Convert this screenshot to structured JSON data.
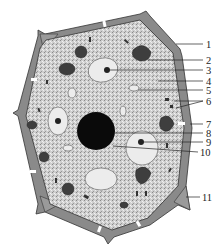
{
  "diagram": {
    "title": "",
    "type": "plant cell structure",
    "colors": {
      "background": "#ffffff",
      "cytoplasm": "#c9c9c9",
      "cell_wall": "#7a7a7a",
      "cell_wall_edge": "#3a3a3a",
      "vacuole": "#e8e8e8",
      "nucleus": "#0a0a0a",
      "plastid": "#4a4a4a",
      "leader_line": "#222222"
    },
    "labels": [
      {
        "n": "1",
        "x": 206,
        "y": 40
      },
      {
        "n": "2",
        "x": 206,
        "y": 56
      },
      {
        "n": "3",
        "x": 206,
        "y": 66
      },
      {
        "n": "4",
        "x": 206,
        "y": 77
      },
      {
        "n": "5",
        "x": 206,
        "y": 86
      },
      {
        "n": "6",
        "x": 206,
        "y": 97
      },
      {
        "n": "7",
        "x": 206,
        "y": 120
      },
      {
        "n": "8",
        "x": 206,
        "y": 129
      },
      {
        "n": "9",
        "x": 206,
        "y": 138
      },
      {
        "n": "10",
        "x": 200,
        "y": 148
      },
      {
        "n": "11",
        "x": 202,
        "y": 193
      }
    ]
  }
}
